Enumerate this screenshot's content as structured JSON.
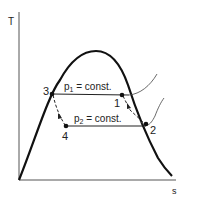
{
  "diagram": {
    "type": "T-s diagram (vapor power cycle)",
    "axes": {
      "y_label": "T",
      "x_label": "s"
    },
    "isobars": [
      {
        "label_main": "p",
        "subscript": "1",
        "suffix": " = const."
      },
      {
        "label_main": "p",
        "subscript": "2",
        "suffix": " = const."
      }
    ],
    "points": [
      {
        "id": "1",
        "label": "1"
      },
      {
        "id": "2",
        "label": "2"
      },
      {
        "id": "3",
        "label": "3"
      },
      {
        "id": "4",
        "label": "4"
      }
    ],
    "colors": {
      "line": "#111111",
      "background": "#ffffff"
    }
  }
}
